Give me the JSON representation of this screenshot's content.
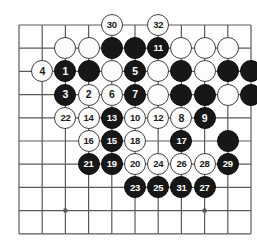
{
  "figure": {
    "kind": "go-board-diagram",
    "board_lines_x": 11,
    "board_lines_y": 10,
    "grid_spacing_px": 23.2,
    "origin_x_px": 19,
    "origin_y_px": 25,
    "stone_diameter_px": 22,
    "colors": {
      "black_stone": "#171717",
      "white_stone": "#fdfdfd",
      "white_stone_border": "#404040",
      "grid_line": "#5a5a5a",
      "background": "#ffffff",
      "black_label": "#ffffff",
      "white_label": "#1a1a1a"
    },
    "star_points": [
      {
        "col": 2,
        "row": 8
      },
      {
        "col": 8,
        "row": 8
      }
    ]
  },
  "stones": [
    {
      "col": 4,
      "row": 0,
      "color": "white",
      "label": "30"
    },
    {
      "col": 6,
      "row": 0,
      "color": "white",
      "label": "32"
    },
    {
      "col": 2,
      "row": 1,
      "color": "white",
      "label": ""
    },
    {
      "col": 3,
      "row": 1,
      "color": "white",
      "label": ""
    },
    {
      "col": 4,
      "row": 1,
      "color": "black",
      "label": ""
    },
    {
      "col": 5,
      "row": 1,
      "color": "black",
      "label": ""
    },
    {
      "col": 6,
      "row": 1,
      "color": "black",
      "label": "11"
    },
    {
      "col": 7,
      "row": 1,
      "color": "white",
      "label": ""
    },
    {
      "col": 8,
      "row": 1,
      "color": "white",
      "label": ""
    },
    {
      "col": 9,
      "row": 1,
      "color": "white",
      "label": ""
    },
    {
      "col": 1,
      "row": 2,
      "color": "white",
      "label": "4"
    },
    {
      "col": 2,
      "row": 2,
      "color": "black",
      "label": "1"
    },
    {
      "col": 3,
      "row": 2,
      "color": "black",
      "label": ""
    },
    {
      "col": 4,
      "row": 2,
      "color": "white",
      "label": ""
    },
    {
      "col": 5,
      "row": 2,
      "color": "black",
      "label": "5"
    },
    {
      "col": 6,
      "row": 2,
      "color": "white",
      "label": ""
    },
    {
      "col": 7,
      "row": 2,
      "color": "black",
      "label": ""
    },
    {
      "col": 8,
      "row": 2,
      "color": "white",
      "label": ""
    },
    {
      "col": 9,
      "row": 2,
      "color": "black",
      "label": ""
    },
    {
      "col": 10,
      "row": 2,
      "color": "black",
      "label": ""
    },
    {
      "col": 2,
      "row": 3,
      "color": "black",
      "label": "3"
    },
    {
      "col": 3,
      "row": 3,
      "color": "white",
      "label": "2"
    },
    {
      "col": 4,
      "row": 3,
      "color": "white",
      "label": "6"
    },
    {
      "col": 5,
      "row": 3,
      "color": "black",
      "label": "7"
    },
    {
      "col": 6,
      "row": 3,
      "color": "white",
      "label": ""
    },
    {
      "col": 7,
      "row": 3,
      "color": "black",
      "label": ""
    },
    {
      "col": 8,
      "row": 3,
      "color": "black",
      "label": ""
    },
    {
      "col": 9,
      "row": 3,
      "color": "white",
      "label": ""
    },
    {
      "col": 10,
      "row": 3,
      "color": "black",
      "label": ""
    },
    {
      "col": 2,
      "row": 4,
      "color": "white",
      "label": "22"
    },
    {
      "col": 3,
      "row": 4,
      "color": "white",
      "label": "14"
    },
    {
      "col": 4,
      "row": 4,
      "color": "black",
      "label": "13"
    },
    {
      "col": 5,
      "row": 4,
      "color": "white",
      "label": "10"
    },
    {
      "col": 6,
      "row": 4,
      "color": "white",
      "label": "12"
    },
    {
      "col": 7,
      "row": 4,
      "color": "white",
      "label": "8"
    },
    {
      "col": 8,
      "row": 4,
      "color": "black",
      "label": "9"
    },
    {
      "col": 3,
      "row": 5,
      "color": "white",
      "label": "16"
    },
    {
      "col": 4,
      "row": 5,
      "color": "black",
      "label": "15"
    },
    {
      "col": 5,
      "row": 5,
      "color": "white",
      "label": "18"
    },
    {
      "col": 7,
      "row": 5,
      "color": "black",
      "label": "17"
    },
    {
      "col": 9,
      "row": 5,
      "color": "black",
      "label": ""
    },
    {
      "col": 3,
      "row": 6,
      "color": "black",
      "label": "21"
    },
    {
      "col": 4,
      "row": 6,
      "color": "black",
      "label": "19"
    },
    {
      "col": 5,
      "row": 6,
      "color": "white",
      "label": "20"
    },
    {
      "col": 6,
      "row": 6,
      "color": "white",
      "label": "24"
    },
    {
      "col": 7,
      "row": 6,
      "color": "white",
      "label": "26"
    },
    {
      "col": 8,
      "row": 6,
      "color": "white",
      "label": "28"
    },
    {
      "col": 9,
      "row": 6,
      "color": "black",
      "label": "29"
    },
    {
      "col": 5,
      "row": 7,
      "color": "black",
      "label": "23"
    },
    {
      "col": 6,
      "row": 7,
      "color": "black",
      "label": "25"
    },
    {
      "col": 7,
      "row": 7,
      "color": "black",
      "label": "31"
    },
    {
      "col": 8,
      "row": 7,
      "color": "black",
      "label": "27"
    }
  ]
}
